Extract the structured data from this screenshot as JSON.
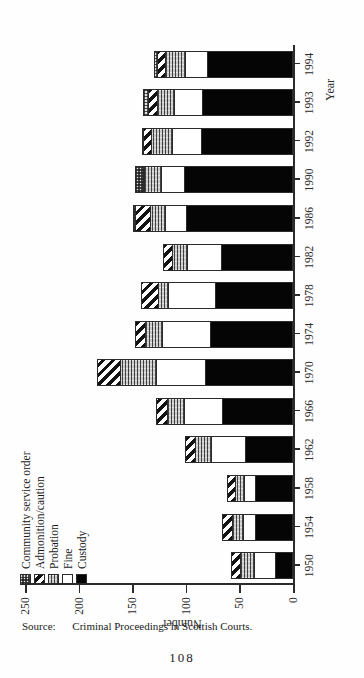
{
  "page": {
    "folio": "108",
    "source_label": "Source:",
    "source_text": "Criminal Proceedings in Scottish Courts."
  },
  "legend": {
    "items": [
      {
        "label": "Community service order",
        "swatch": "checkered-stipple",
        "color": "#e2e2e2"
      },
      {
        "label": "Admonition/caution",
        "swatch": "diagonal-hatch",
        "color": "#131313"
      },
      {
        "label": "Probation",
        "swatch": "horizontal-line-gray",
        "color": "#c9c9c9"
      },
      {
        "label": "Fine",
        "swatch": "white-empty",
        "color": "#ffffff"
      },
      {
        "label": "Custody",
        "swatch": "solid-black",
        "color": "#050505"
      }
    ]
  },
  "chart_data": {
    "type": "bar",
    "stacked": true,
    "title": "",
    "xlabel": "Year",
    "ylabel": "Number",
    "ylim": [
      0,
      250
    ],
    "yticks": [
      0,
      50,
      100,
      150,
      200,
      250
    ],
    "grid": false,
    "legend_position": "top-left",
    "categories": [
      "1950",
      "1954",
      "1958",
      "1962",
      "1966",
      "1970",
      "1974",
      "1978",
      "1982",
      "1986",
      "1990",
      "1992",
      "1993",
      "1994"
    ],
    "series": [
      {
        "name": "Custody",
        "values": [
          17,
          35,
          35,
          45,
          66,
          82,
          77,
          73,
          67,
          100,
          102,
          86,
          85,
          80
        ]
      },
      {
        "name": "Fine",
        "values": [
          20,
          13,
          12,
          32,
          37,
          47,
          46,
          45,
          33,
          20,
          22,
          28,
          27,
          22
        ]
      },
      {
        "name": "Probation",
        "values": [
          14,
          11,
          9,
          16,
          16,
          34,
          17,
          10,
          15,
          15,
          17,
          20,
          17,
          19
        ]
      },
      {
        "name": "Admonition/caution",
        "values": [
          10,
          10,
          8,
          11,
          12,
          23,
          10,
          17,
          9,
          15,
          2,
          9,
          9,
          9
        ]
      },
      {
        "name": "Community service order",
        "values": [
          0,
          0,
          0,
          0,
          0,
          0,
          0,
          0,
          0,
          3,
          8,
          2,
          6,
          3
        ]
      }
    ],
    "totals": [
      61,
      69,
      64,
      104,
      131,
      186,
      150,
      145,
      124,
      153,
      151,
      145,
      144,
      133
    ]
  }
}
